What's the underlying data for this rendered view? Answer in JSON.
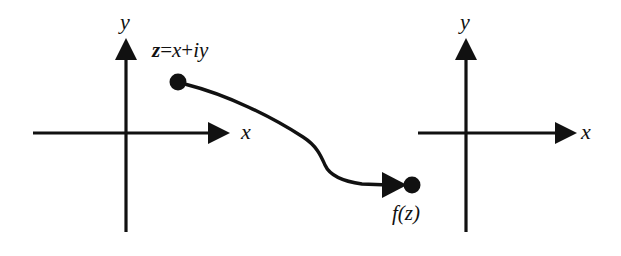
{
  "figure": {
    "kind": "complex-function-mapping-diagram",
    "width": 621,
    "height": 256,
    "background_color": "#ffffff",
    "ink_color": "#111111"
  },
  "planes": [
    {
      "id": "z-plane",
      "x_axis_label": "x",
      "y_axis_label": "y",
      "origin": {
        "x": 126,
        "y": 133
      },
      "x_axis": {
        "x_start": 33,
        "x_tip": 228,
        "y": 133
      },
      "y_axis": {
        "x": 126,
        "y_tip": 40,
        "y_end": 232
      }
    },
    {
      "id": "w-plane",
      "x_axis_label": "x",
      "y_axis_label": "y",
      "origin": {
        "x": 466,
        "y": 133
      },
      "x_axis": {
        "x_start": 418,
        "x_tip": 575,
        "y": 133
      },
      "y_axis": {
        "x": 466,
        "y_tip": 40,
        "y_end": 232
      }
    }
  ],
  "points": {
    "source": {
      "label_parts": {
        "var": "z",
        "equals": "=",
        "real": "x",
        "plus": "+",
        "imag_unit": "i",
        "imag": "y"
      },
      "label_text": "z = x+iy",
      "center": {
        "x": 178,
        "y": 82
      },
      "radius": 8.5
    },
    "target": {
      "label_text": "f(z)",
      "center": {
        "x": 412,
        "y": 185
      },
      "radius": 8.5
    }
  },
  "mapping_arrow": {
    "description": "S-shaped curve from z to f(z)",
    "path": "M 186.5 84.5 C 228 95 272 117 303 137 C 317 146 321 156 325 165 C 329 174 340 181 362 184 L 390 185",
    "arrow_tip": {
      "x": 406,
      "y": 185
    },
    "stroke_width": 3.4
  },
  "labels": [
    {
      "name": "z-plane-y-label",
      "text": "y",
      "x": 120,
      "y": 11
    },
    {
      "name": "z-plane-x-label",
      "text": "x",
      "x": 241,
      "y": 122
    },
    {
      "name": "w-plane-y-label",
      "text": "y",
      "x": 460,
      "y": 11
    },
    {
      "name": "w-plane-x-label",
      "text": "x",
      "x": 581,
      "y": 122
    },
    {
      "name": "source-point-label",
      "text": "z = x+iy",
      "x": 152,
      "y": 40
    },
    {
      "name": "target-point-label",
      "text": "f(z)",
      "x": 392,
      "y": 203
    }
  ]
}
